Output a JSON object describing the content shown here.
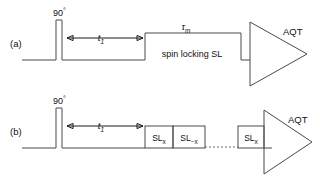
{
  "figure": {
    "type": "nmr-pulse-sequence-diagram",
    "background_color": "#ffffff",
    "line_color": "#4a4a4a",
    "text_color": "#111111"
  },
  "panels": [
    {
      "id": "a",
      "tag": "(a)",
      "excitation_pulse_label": "90",
      "excitation_pulse_degree": "°",
      "evolution_label": "t",
      "evolution_sub": "1",
      "mixing_label": "τ",
      "mixing_sub": "m",
      "block_label": "spin locking SL",
      "acquire_label": "AQT"
    },
    {
      "id": "b",
      "tag": "(b)",
      "excitation_pulse_label": "90",
      "excitation_pulse_degree": "°",
      "evolution_label": "t",
      "evolution_sub": "1",
      "acquire_label": "AQT",
      "sl_boxes": [
        {
          "label": "SL",
          "sub": "x"
        },
        {
          "label": "SL",
          "sub": "−x"
        },
        {
          "label": "SL",
          "sub": "x"
        }
      ],
      "ellipsis": "dotted-connector"
    }
  ]
}
